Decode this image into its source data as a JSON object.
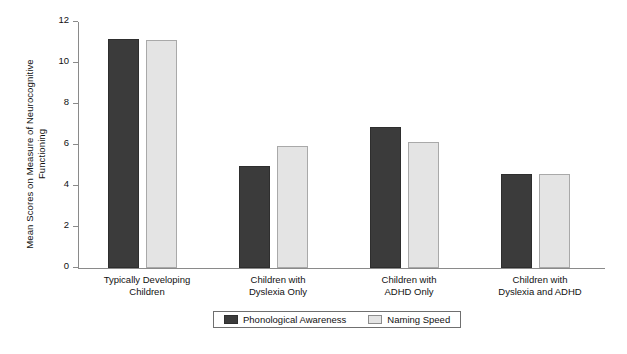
{
  "chart_data": {
    "type": "bar",
    "title": "",
    "xlabel": "",
    "ylabel": "Mean Scores on Measure of Neurocognitive Functioning",
    "ylabel_lines": [
      "Mean Scores on Measure of Neurocognitive",
      "Functioning"
    ],
    "ylim": [
      0,
      12
    ],
    "yticks": [
      0,
      2,
      4,
      6,
      8,
      10,
      12
    ],
    "ytick_labels": [
      "0",
      "2",
      "4",
      "6",
      "8",
      "10",
      "12"
    ],
    "grid": false,
    "legend_position": "bottom-center",
    "categories": [
      "Typically Developing Children",
      "Children with Dyslexia Only",
      "Children with ADHD Only",
      "Children with Dyslexia and ADHD"
    ],
    "category_lines": [
      [
        "Typically Developing",
        "Children"
      ],
      [
        "Children with",
        "Dyslexia Only"
      ],
      [
        "Children with",
        "ADHD Only"
      ],
      [
        "Children with",
        "Dyslexia and ADHD"
      ]
    ],
    "series": [
      {
        "name": "Phonological Awareness",
        "color": "#3b3b3b",
        "values": [
          11.15,
          5.0,
          6.9,
          4.6
        ]
      },
      {
        "name": "Naming Speed",
        "color": "#e4e4e4",
        "values": [
          11.1,
          5.95,
          6.15,
          4.6
        ]
      }
    ]
  },
  "legend": {
    "items": [
      {
        "label": "Phonological Awareness",
        "swatch": "dark"
      },
      {
        "label": "Naming Speed",
        "swatch": "light"
      }
    ]
  },
  "colors": {
    "axis": "#8a8a8a",
    "text": "#111111",
    "series_dark": "#3b3b3b",
    "series_light": "#e4e4e4",
    "background": "#ffffff"
  }
}
